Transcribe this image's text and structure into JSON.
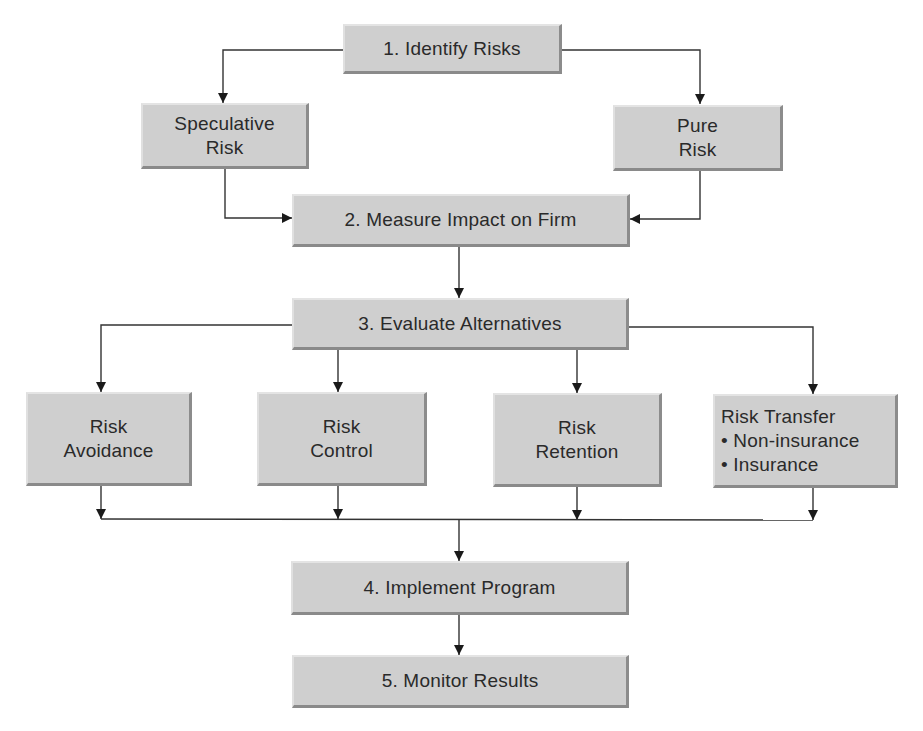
{
  "diagram": {
    "colors": {
      "box_fill": "#cfcfcf",
      "line": "#333333",
      "text": "#2a2a2a",
      "background": "#ffffff"
    },
    "nodes": {
      "identify": {
        "label": "1. Identify Risks"
      },
      "speculative": {
        "line1": "Speculative",
        "line2": "Risk"
      },
      "pure": {
        "line1": "Pure",
        "line2": "Risk"
      },
      "measure": {
        "label": "2. Measure Impact on Firm"
      },
      "evaluate": {
        "label": "3. Evaluate Alternatives"
      },
      "avoidance": {
        "line1": "Risk",
        "line2": "Avoidance"
      },
      "control": {
        "line1": "Risk",
        "line2": "Control"
      },
      "retention": {
        "line1": "Risk",
        "line2": "Retention"
      },
      "transfer": {
        "line1": "Risk Transfer",
        "line2": "• Non-insurance",
        "line3": "• Insurance"
      },
      "implement": {
        "label": "4. Implement Program"
      },
      "monitor": {
        "label": "5. Monitor Results"
      }
    },
    "edges": [
      {
        "from": "identify",
        "to": "speculative"
      },
      {
        "from": "identify",
        "to": "pure"
      },
      {
        "from": "speculative",
        "to": "measure"
      },
      {
        "from": "pure",
        "to": "measure"
      },
      {
        "from": "measure",
        "to": "evaluate"
      },
      {
        "from": "evaluate",
        "to": "avoidance"
      },
      {
        "from": "evaluate",
        "to": "control"
      },
      {
        "from": "evaluate",
        "to": "retention"
      },
      {
        "from": "evaluate",
        "to": "transfer"
      },
      {
        "from": "avoidance",
        "to": "implement"
      },
      {
        "from": "control",
        "to": "implement"
      },
      {
        "from": "retention",
        "to": "implement"
      },
      {
        "from": "transfer",
        "to": "implement"
      },
      {
        "from": "implement",
        "to": "monitor"
      }
    ]
  }
}
